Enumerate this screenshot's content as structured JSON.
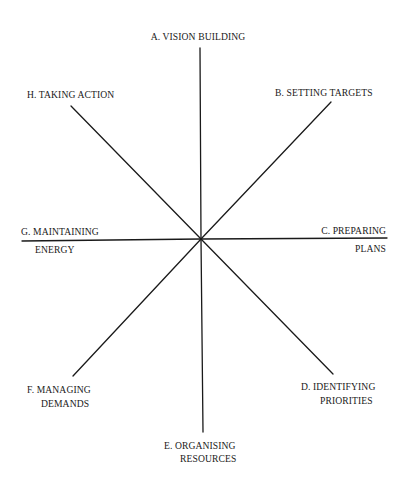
{
  "diagram": {
    "type": "radial-axes",
    "center": {
      "x": 201,
      "y": 239
    },
    "line_color": "#1a1a1a",
    "spokes": [
      {
        "id": "A",
        "label": "A. VISION BUILDING",
        "direction": "north"
      },
      {
        "id": "B",
        "label": "B. SETTING TARGETS",
        "direction": "north-east"
      },
      {
        "id": "C",
        "label_line1": "C. PREPARING",
        "label_line2": "PLANS",
        "direction": "east"
      },
      {
        "id": "D",
        "label_line1": "D. IDENTIFYING",
        "label_line2": "PRIORITIES",
        "direction": "south-east"
      },
      {
        "id": "E",
        "label_line1": "E. ORGANISING",
        "label_line2": "RESOURCES",
        "direction": "south"
      },
      {
        "id": "F",
        "label_line1": "F. MANAGING",
        "label_line2": "DEMANDS",
        "direction": "south-west"
      },
      {
        "id": "G",
        "label_line1": "G. MAINTAINING",
        "label_line2": "ENERGY",
        "direction": "west"
      },
      {
        "id": "H",
        "label": "H. TAKING ACTION",
        "direction": "north-west"
      }
    ]
  }
}
